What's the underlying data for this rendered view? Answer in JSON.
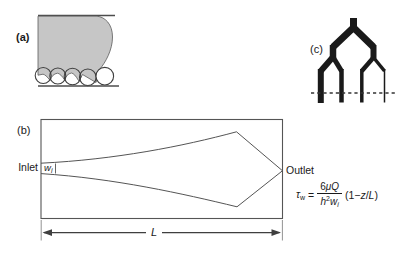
{
  "figure": {
    "panel_a": {
      "label": "(a)"
    },
    "panel_b": {
      "label": "(b)",
      "inlet_label": "Inlet",
      "outlet_label": "Outlet",
      "inlet_width": {
        "var": "w",
        "sub": "i"
      },
      "length_label": "L"
    },
    "panel_c": {
      "label": "(c)"
    },
    "equation": {
      "tau": "τ",
      "tau_sub": "w",
      "equals": "=",
      "numerator": {
        "coeff": "6",
        "vars": "μQ"
      },
      "denominator": {
        "h": "h",
        "exp": "2",
        "w": "w",
        "sub": "i"
      },
      "factor": {
        "open": "(1−",
        "z": "z",
        "slash": "/",
        "L": "L",
        "close": ")"
      }
    }
  },
  "colors": {
    "background": "#ffffff",
    "meniscus_gray": "#c6c6c6",
    "outline_gray": "#4d4d4d",
    "manifold_black": "#1a1a1a",
    "text": "#1a1a1a"
  }
}
